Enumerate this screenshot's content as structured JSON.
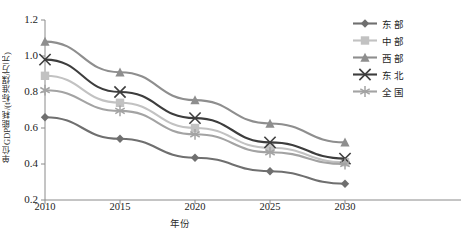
{
  "chart_data": {
    "type": "line",
    "title": "",
    "xlabel": "年份",
    "ylabel": "单位GDP能耗/(t标准煤/万元)",
    "categories": [
      "2010",
      "2015",
      "2020",
      "2025",
      "2030"
    ],
    "x": [
      2010,
      2015,
      2020,
      2025,
      2030
    ],
    "ylim": [
      0.2,
      1.2
    ],
    "yticks": [
      "0.2",
      "0.4",
      "0.6",
      "0.8",
      "1.0",
      "1.2"
    ],
    "ytick_values": [
      0.2,
      0.4,
      0.6,
      0.8,
      1.0,
      1.2
    ],
    "grid": false,
    "legend_position": "right-top",
    "series": [
      {
        "name": "东部",
        "marker": "diamond",
        "color": "#6f6f6f",
        "values": [
          0.66,
          0.54,
          0.435,
          0.36,
          0.29
        ]
      },
      {
        "name": "中部",
        "marker": "square",
        "color": "#c2c2c2",
        "values": [
          0.89,
          0.74,
          0.6,
          0.49,
          0.41
        ]
      },
      {
        "name": "西部",
        "marker": "triangle",
        "color": "#8e8e8e",
        "values": [
          1.08,
          0.91,
          0.755,
          0.625,
          0.52
        ]
      },
      {
        "name": "东北",
        "marker": "x",
        "color": "#3d3d3d",
        "values": [
          0.98,
          0.8,
          0.655,
          0.52,
          0.43
        ]
      },
      {
        "name": "全国",
        "marker": "asterisk",
        "color": "#a3a3a3",
        "values": [
          0.81,
          0.695,
          0.565,
          0.465,
          0.4
        ]
      }
    ]
  },
  "axis": {
    "y_title": "单位GDP能耗/(t标准煤/万元)",
    "x_title": "年份"
  },
  "caption": "",
  "colors": {
    "axis": "#8a8a8a",
    "text": "#242424",
    "background": "#ffffff"
  }
}
